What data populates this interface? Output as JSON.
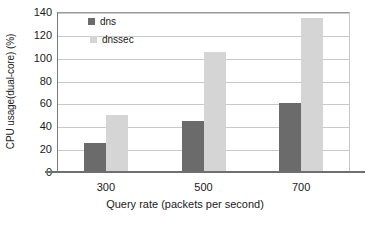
{
  "chart_data": {
    "type": "bar",
    "title": "",
    "subtitle": "",
    "xlabel": "Query rate (packets per second)",
    "ylabel": "CPU usage(dual-core) (%)",
    "categories": [
      "300",
      "500",
      "700"
    ],
    "series": [
      {
        "name": "dns",
        "values": [
          25,
          45,
          60
        ],
        "color": "#6b6b6b"
      },
      {
        "name": "dnssec",
        "values": [
          50,
          105,
          135
        ],
        "color": "#d5d5d5"
      }
    ],
    "ylim": [
      0,
      140
    ],
    "ytick_step": 20,
    "yticks": [
      0,
      20,
      40,
      60,
      80,
      100,
      120,
      140
    ],
    "ytick_labels": [
      "0",
      "20",
      "40",
      "60",
      "80",
      "100",
      "120",
      "140"
    ],
    "grid": "horizontal",
    "legend_position": "top-left-inside",
    "legend_entries": [
      "dns",
      "dnssec"
    ],
    "annotations": [],
    "plot_border": true,
    "axis_line_color": "#6f6f6f",
    "gridline_color": "#c9c9c9"
  }
}
